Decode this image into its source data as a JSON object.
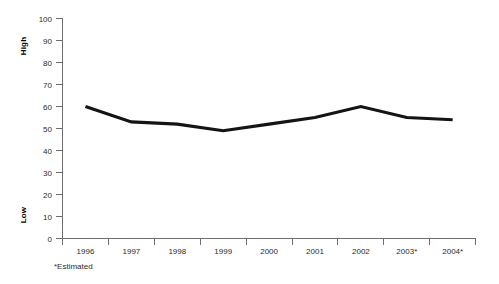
{
  "chart_data": {
    "type": "line",
    "title": "",
    "subtitle": "",
    "xlabel": "",
    "ylabel_top": "High",
    "ylabel_bottom": "Low",
    "categories": [
      "1996",
      "1997",
      "1998",
      "1999",
      "2000",
      "2001",
      "2002",
      "2003*",
      "2004*"
    ],
    "values": [
      60,
      53,
      52,
      49,
      52,
      55,
      60,
      55,
      54
    ],
    "series": [
      {
        "name": "value",
        "values": [
          60,
          53,
          52,
          49,
          52,
          55,
          60,
          55,
          54
        ],
        "color": "#141414"
      }
    ],
    "ylim": [
      0,
      100
    ],
    "ytick_values": [
      0,
      10,
      20,
      30,
      40,
      50,
      60,
      70,
      80,
      90,
      100
    ],
    "ytick_labels": [
      "0",
      "10",
      "20",
      "30",
      "40",
      "50",
      "60",
      "70",
      "80",
      "90",
      "100"
    ],
    "grid": false,
    "legend": false,
    "legend_position": "none",
    "footnote": "*Estimated",
    "axis_color": "#6e6e6e",
    "line_color": "#141414",
    "background_color": "#ffffff"
  },
  "axis": {
    "y_title_high": "High",
    "y_title_low": "Low"
  },
  "footnote": {
    "text": "*Estimated"
  }
}
